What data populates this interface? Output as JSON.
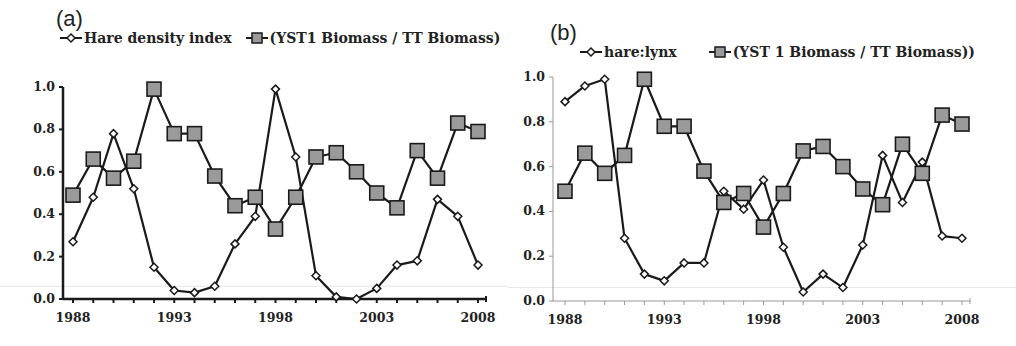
{
  "chart_data": [
    {
      "panel_label": "(a)",
      "type": "line",
      "title": "",
      "xlabel": "",
      "ylabel": "",
      "x": [
        1988,
        1989,
        1990,
        1991,
        1992,
        1993,
        1994,
        1995,
        1996,
        1997,
        1998,
        1999,
        2000,
        2001,
        2002,
        2003,
        2004,
        2005,
        2006,
        2007,
        2008
      ],
      "xticks": [
        "1988",
        "1993",
        "1998",
        "2003",
        "2008"
      ],
      "yticks": [
        "0.0",
        "0.2",
        "0.4",
        "0.6",
        "0.8",
        "1.0"
      ],
      "ylim": [
        0,
        1
      ],
      "xlim": [
        1988,
        2008
      ],
      "grid": false,
      "legend_position": "top",
      "series": [
        {
          "name": "Hare density index",
          "marker": "diamond",
          "values": [
            0.27,
            0.48,
            0.78,
            0.52,
            0.15,
            0.04,
            0.03,
            0.06,
            0.26,
            0.39,
            0.99,
            0.67,
            0.11,
            0.01,
            0.0,
            0.05,
            0.16,
            0.18,
            0.47,
            0.39,
            0.16
          ]
        },
        {
          "name": "(YST1 Biomass / TT Biomass)",
          "marker": "square",
          "values": [
            0.49,
            0.66,
            0.57,
            0.65,
            0.99,
            0.78,
            0.78,
            0.58,
            0.44,
            0.48,
            0.33,
            0.48,
            0.67,
            0.69,
            0.6,
            0.5,
            0.43,
            0.7,
            0.57,
            0.83,
            0.79
          ]
        }
      ]
    },
    {
      "panel_label": "(b)",
      "type": "line",
      "title": "",
      "xlabel": "",
      "ylabel": "",
      "x": [
        1988,
        1989,
        1990,
        1991,
        1992,
        1993,
        1994,
        1995,
        1996,
        1997,
        1998,
        1999,
        2000,
        2001,
        2002,
        2003,
        2004,
        2005,
        2006,
        2007,
        2008
      ],
      "xticks": [
        "1988",
        "1993",
        "1998",
        "2003",
        "2008"
      ],
      "yticks": [
        "0.0",
        "0.2",
        "0.4",
        "0.6",
        "0.8",
        "1.0"
      ],
      "ylim": [
        0,
        1
      ],
      "xlim": [
        1988,
        2008
      ],
      "grid": false,
      "legend_position": "top",
      "series": [
        {
          "name": "hare:lynx",
          "marker": "diamond",
          "values": [
            0.89,
            0.96,
            0.99,
            0.28,
            0.12,
            0.09,
            0.17,
            0.17,
            0.49,
            0.41,
            0.54,
            0.24,
            0.04,
            0.12,
            0.06,
            0.25,
            0.65,
            0.44,
            0.62,
            0.29,
            0.28
          ]
        },
        {
          "name": "(YST 1 Biomass / TT Biomass))",
          "marker": "square",
          "values": [
            0.49,
            0.66,
            0.57,
            0.65,
            0.99,
            0.78,
            0.78,
            0.58,
            0.44,
            0.48,
            0.33,
            0.48,
            0.67,
            0.69,
            0.6,
            0.5,
            0.43,
            0.7,
            0.57,
            0.83,
            0.79
          ]
        }
      ]
    }
  ],
  "panels": [
    {
      "label": "(a)",
      "legend": [
        "Hare density index",
        "(YST1 Biomass / TT Biomass)"
      ]
    },
    {
      "label": "(b)",
      "legend": [
        "hare:lynx",
        "(YST 1 Biomass / TT Biomass))"
      ]
    }
  ],
  "colors": {
    "line": "#1a1a1a",
    "square_fill": "#9a9a9a",
    "diamond_fill": "#ffffff"
  }
}
